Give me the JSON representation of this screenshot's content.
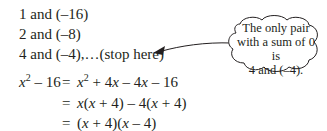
{
  "pairs": [
    {
      "text": "1 and (–16)"
    },
    {
      "text": "2 and (–8)"
    },
    {
      "text": "4 and (–4),…(stop here)"
    }
  ],
  "callout": {
    "line1": "The only pair",
    "line2": "with a sum of 0 is",
    "line3": "4 and (–4)."
  },
  "equations": {
    "lhs": {
      "var": "x",
      "exp": "2",
      "rest": " – 16"
    },
    "eq": "=",
    "rows": [
      {
        "parts": [
          "x",
          "2",
          " + 4",
          "x",
          " – 4",
          "x",
          " – 16"
        ]
      },
      {
        "text_pre": "",
        "parts": [
          "x",
          "(",
          "x",
          " + 4) – 4(",
          "x",
          " + 4)"
        ]
      },
      {
        "parts": [
          "(",
          "x",
          " + 4)(",
          "x",
          " – 4)"
        ]
      }
    ]
  },
  "colors": {
    "text": "#231f20",
    "stroke": "#231f20"
  }
}
